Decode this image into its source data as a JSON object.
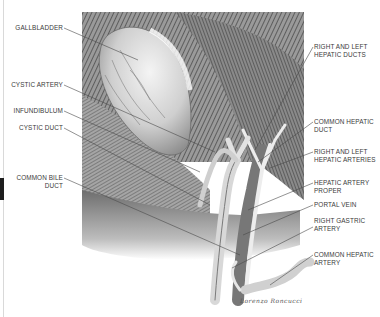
{
  "figure": {
    "signature": "Lorenzo Roncucci"
  },
  "labels_left": [
    {
      "id": "gallbladder",
      "text": "GALLBLADDER"
    },
    {
      "id": "cystic-artery",
      "text": "CYSTIC ARTERY"
    },
    {
      "id": "infundibulum",
      "text": "INFUNDIBULUM"
    },
    {
      "id": "cystic-duct",
      "text": "CYSTIC DUCT"
    },
    {
      "id": "common-bile-duct",
      "line1": "COMMON BILE",
      "line2": "DUCT"
    }
  ],
  "labels_right": [
    {
      "id": "right-left-hepatic-ducts",
      "line1": "RIGHT AND LEFT",
      "line2": "HEPATIC DUCTS"
    },
    {
      "id": "common-hepatic-duct",
      "line1": "COMMON HEPATIC",
      "line2": "DUCT"
    },
    {
      "id": "right-left-hepatic-arteries",
      "line1": "RIGHT AND LEFT",
      "line2": "HEPATIC ARTERIES"
    },
    {
      "id": "hepatic-artery-proper",
      "line1": "HEPATIC ARTERY",
      "line2": "PROPER"
    },
    {
      "id": "portal-vein",
      "text": "PORTAL VEIN"
    },
    {
      "id": "right-gastric-artery",
      "line1": "RIGHT GASTRIC",
      "line2": "ARTERY"
    },
    {
      "id": "common-hepatic-artery",
      "line1": "COMMON HEPATIC",
      "line2": "ARTERY"
    }
  ],
  "colors": {
    "background": "#ffffff",
    "text": "#3a3a3a",
    "leader": "#4a4a4a",
    "tissue_dark": "#555555",
    "tissue_light": "#d8d8d8"
  }
}
